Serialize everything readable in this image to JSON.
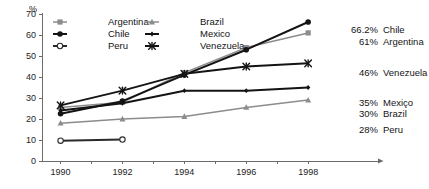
{
  "chart_data": {
    "type": "line",
    "title": "",
    "subtitle": "",
    "xlabel": "",
    "ylabel": "%",
    "y_unit_label": "%",
    "x": [
      1990,
      1992,
      1994,
      1996,
      1998
    ],
    "xtick_labels": [
      "1990",
      "1992",
      "1994",
      "1996",
      "1998"
    ],
    "ytick_labels": [
      "0",
      "10",
      "20",
      "30",
      "40",
      "50",
      "60",
      "70"
    ],
    "ytick_values": [
      0,
      10,
      20,
      30,
      40,
      50,
      60,
      70
    ],
    "xlim": [
      1989.4,
      1998.9
    ],
    "ylim": [
      0,
      70
    ],
    "grid": false,
    "legend_position": "top-left-inside",
    "minor_xticks": [
      1991,
      1993,
      1995,
      1997
    ],
    "series": [
      {
        "name": "Argentina",
        "marker": "square",
        "color": "#8c8c8c",
        "line_style": "solid",
        "values": [
          25.5,
          28.0,
          42.0,
          54.0,
          61.0
        ],
        "end_value_label": "61%"
      },
      {
        "name": "Brazil",
        "marker": "triangle",
        "color": "#8c8c8c",
        "line_style": "solid",
        "values": [
          18.0,
          20.0,
          21.2,
          25.5,
          29.0
        ],
        "end_value_label": "30%"
      },
      {
        "name": "Chile",
        "marker": "circle-filled",
        "color": "#141414",
        "line_style": "solid",
        "values": [
          22.5,
          28.5,
          41.0,
          53.0,
          66.2
        ],
        "end_value_label": "66.2%"
      },
      {
        "name": "Mexico",
        "marker": "diamond-small",
        "color": "#141414",
        "line_style": "solid",
        "values": [
          24.0,
          27.5,
          33.5,
          33.5,
          35.0
        ],
        "end_value_label": "35%"
      },
      {
        "name": "Peru",
        "marker": "circle-open",
        "color": "#2a2a2a",
        "line_style": "solid",
        "values": [
          9.7,
          10.2,
          null,
          null,
          null
        ],
        "end_value_label": "28%"
      },
      {
        "name": "Venezuela",
        "marker": "cross-x",
        "color": "#141414",
        "line_style": "solid",
        "values": [
          26.5,
          33.5,
          41.5,
          45.0,
          46.5
        ],
        "end_value_label": "46%"
      }
    ]
  },
  "legend": {
    "items": [
      {
        "label": "Argentina",
        "marker": "square",
        "color": "#8c8c8c"
      },
      {
        "label": "Brazil",
        "marker": "triangle",
        "color": "#8c8c8c"
      },
      {
        "label": "Chile",
        "marker": "circle-filled",
        "color": "#141414"
      },
      {
        "label": "Mexico",
        "marker": "diamond-small",
        "color": "#141414"
      },
      {
        "label": "Peru",
        "marker": "circle-open",
        "color": "#2a2a2a"
      },
      {
        "label": "Venezuela",
        "marker": "cross-x",
        "color": "#141414"
      }
    ]
  },
  "end_labels": [
    {
      "value": "66.2%",
      "name": "Chile"
    },
    {
      "value": "61%",
      "name": "Argentina"
    },
    {
      "value": "46%",
      "name": "Venezuela"
    },
    {
      "value": "35%",
      "name": "Mexiço"
    },
    {
      "value": "30%",
      "name": "Brazil"
    },
    {
      "value": "28%",
      "name": "Peru"
    }
  ],
  "colors": {
    "axis": "#6b6b6b",
    "text": "#141414",
    "dark_series": "#141414",
    "gray_series": "#8c8c8c",
    "background": "#ffffff"
  }
}
